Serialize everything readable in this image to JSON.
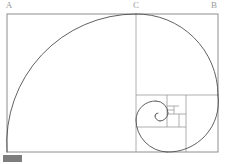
{
  "figure": {
    "canvas": {
      "width": 226,
      "height": 164
    },
    "background_color": "#ffffff",
    "line_color": "#8e8e8e",
    "spiral_color": "#4f4f4f",
    "label_color": "#9a9a9a"
  },
  "labels": {
    "vertex_a": "A",
    "vertex_b": "B",
    "vertex_c": "C"
  },
  "label_positions": {
    "vertex_a": {
      "x": 9,
      "y": 6
    },
    "vertex_c": {
      "x": 136,
      "y": 6
    },
    "vertex_b": {
      "x": 214,
      "y": 6
    }
  },
  "outer_rectangle": {
    "x": 7,
    "y": 14,
    "width": 211,
    "height": 138,
    "stroke": "#8e8e8e"
  },
  "divider_lines": [
    {
      "name": "vertical-at-c",
      "x1": 136,
      "y1": 14,
      "x2": 136,
      "y2": 152
    },
    {
      "name": "horizontal-second-square",
      "x1": 136,
      "y1": 95,
      "x2": 218,
      "y2": 95
    },
    {
      "name": "vertical-third-square",
      "x1": 186,
      "y1": 95,
      "x2": 186,
      "y2": 152
    },
    {
      "name": "horizontal-fourth-square",
      "x1": 136,
      "y1": 127,
      "x2": 186,
      "y2": 127
    },
    {
      "name": "vertical-fifth-square",
      "x1": 167,
      "y1": 95,
      "x2": 167,
      "y2": 127
    },
    {
      "name": "horizontal-sixth-square",
      "x1": 167,
      "y1": 114,
      "x2": 186,
      "y2": 114
    },
    {
      "name": "vertical-seventh-square",
      "x1": 179,
      "y1": 114,
      "x2": 179,
      "y2": 127
    },
    {
      "name": "horizontal-eighth-square",
      "x1": 167,
      "y1": 106,
      "x2": 179,
      "y2": 106
    },
    {
      "name": "vertical-ninth-square",
      "x1": 174,
      "y1": 106,
      "x2": 174,
      "y2": 114
    },
    {
      "name": "horizontal-tenth-square",
      "x1": 167,
      "y1": 110,
      "x2": 174,
      "y2": 110
    }
  ],
  "spiral_arcs": [
    {
      "name": "arc-square-1",
      "d": "M 7 152 A 129 129 0 0 1 136 14"
    },
    {
      "name": "arc-square-2",
      "d": "M 136 14 A 81 81 0 0 1 218 95"
    },
    {
      "name": "arc-square-3",
      "d": "M 218 95 A 50 50 0 0 1 167 152"
    },
    {
      "name": "arc-square-4",
      "d": "M 167 152 A 32 32 0 0 1 136 120"
    },
    {
      "name": "arc-square-5",
      "d": "M 136 120 A 19 19 0 0 1 156 101"
    },
    {
      "name": "arc-square-6",
      "d": "M 156 101 A 12 12 0 0 1 168 113"
    },
    {
      "name": "arc-square-7",
      "d": "M 168 113 A 8 8 0 0 1 160 121"
    },
    {
      "name": "arc-square-8",
      "d": "M 160 121 A 5 5 0 0 1 155 116"
    },
    {
      "name": "arc-square-9",
      "d": "M 155 116 A 3 3 0 0 1 158 113"
    }
  ],
  "geometry_notes": {
    "ratio": "1.618",
    "description": "Nested golden-ratio squares with inscribed quarter-circle arcs forming a logarithmic spiral"
  },
  "watermark": {
    "present": true,
    "color": "#7d7d7d"
  }
}
